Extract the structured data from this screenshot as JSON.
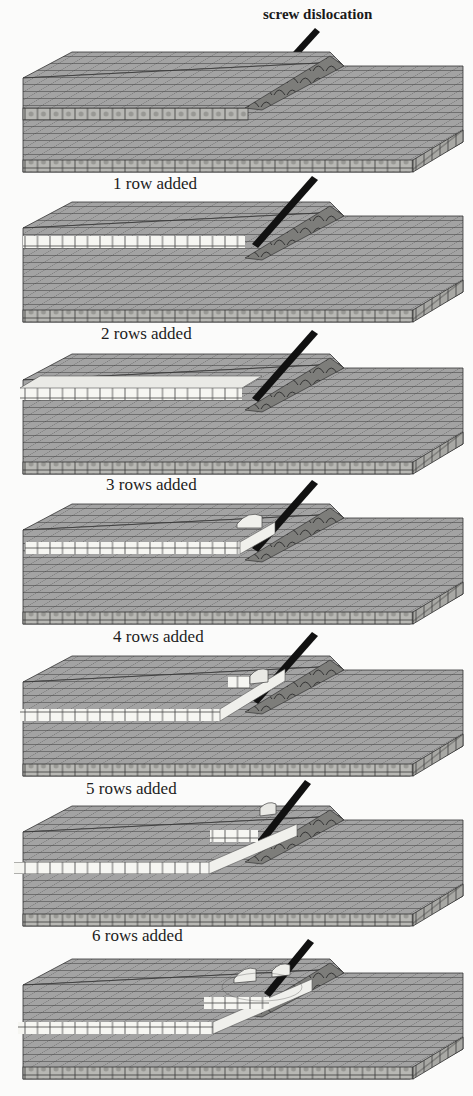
{
  "figure": {
    "annotation": "screw dislocation",
    "panels": [
      {
        "index": 0,
        "caption": "",
        "added_rows": 0
      },
      {
        "index": 1,
        "caption": "1 row added",
        "added_rows": 1
      },
      {
        "index": 2,
        "caption": "2 rows added",
        "added_rows": 2
      },
      {
        "index": 3,
        "caption": "3 rows added",
        "added_rows": 3
      },
      {
        "index": 4,
        "caption": "4 rows added",
        "added_rows": 4
      },
      {
        "index": 5,
        "caption": "5 rows added",
        "added_rows": 5
      },
      {
        "index": 6,
        "caption": "6 rows added",
        "added_rows": 6
      }
    ],
    "colors": {
      "background": "#fbfbfa",
      "slab_surface": "#9a9a9a",
      "hatch_line": "#2a2a2a",
      "added_cube": "#f4f4f0",
      "arrow": "#111111"
    }
  }
}
